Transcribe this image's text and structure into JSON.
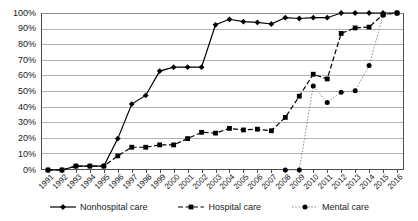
{
  "chart_data": {
    "type": "line",
    "title": "",
    "xlabel": "",
    "ylabel": "",
    "ylim": [
      0,
      100
    ],
    "ytick_labels": [
      "100%",
      "90%",
      "80%",
      "70%",
      "60%",
      "50%",
      "40%",
      "30%",
      "20%",
      "10%",
      "0%"
    ],
    "ytick_values": [
      100,
      90,
      80,
      70,
      60,
      50,
      40,
      30,
      20,
      10,
      0
    ],
    "grid": true,
    "legend_position": "bottom",
    "categories": [
      "1991",
      "1992",
      "1993",
      "1994",
      "1995",
      "1996",
      "1997",
      "1998",
      "1999",
      "2000",
      "2001",
      "2002",
      "2003",
      "2004",
      "2005",
      "2006",
      "2007",
      "2008",
      "2009",
      "2010",
      "2011",
      "2012",
      "2013",
      "2014",
      "2015",
      "2016"
    ],
    "series": [
      {
        "name": "Nonhospital care",
        "marker": "diamond",
        "linestyle": "solid",
        "color": "#000000",
        "values": [
          0,
          0,
          2.5,
          2.5,
          2.5,
          20,
          42,
          47.5,
          63,
          65.5,
          65.5,
          65.5,
          92.5,
          96,
          94.5,
          94,
          93,
          97,
          96.5,
          97,
          97,
          100,
          100,
          100,
          100,
          100
        ]
      },
      {
        "name": "Hospital care",
        "marker": "square",
        "linestyle": "dashed",
        "color": "#000000",
        "values": [
          0,
          0,
          2.5,
          2.5,
          2.5,
          9,
          14.5,
          14.5,
          16,
          16,
          20,
          24,
          23.5,
          26.5,
          25.5,
          26,
          25,
          33.5,
          47,
          61,
          58,
          87,
          90.5,
          91,
          99,
          100
        ]
      },
      {
        "name": "Mental care",
        "marker": "circle",
        "linestyle": "dotted",
        "color": "#000000",
        "values": [
          null,
          null,
          null,
          null,
          null,
          null,
          null,
          null,
          null,
          null,
          null,
          null,
          null,
          null,
          null,
          null,
          null,
          0,
          0,
          53.5,
          43,
          49.5,
          50.5,
          66.5,
          98.5,
          100
        ]
      }
    ]
  },
  "legend": {
    "items": [
      {
        "label": "Nonhospital care"
      },
      {
        "label": "Hospital care"
      },
      {
        "label": "Mental care"
      }
    ]
  }
}
